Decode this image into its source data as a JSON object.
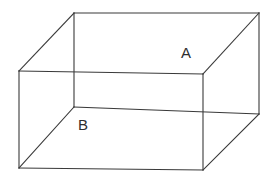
{
  "figure": {
    "name": "rectangular-prism",
    "background_color": "#ffffff",
    "line_color": "#3a3a3a",
    "line_width": 1.1,
    "label_color": "#2e2e2e",
    "labels": [
      {
        "id": "A",
        "text": "A",
        "x": 181,
        "y": 58
      },
      {
        "id": "B",
        "text": "B",
        "x": 78,
        "y": 130
      }
    ],
    "vertices": {
      "back_top_left": {
        "x": 74,
        "y": 13
      },
      "back_top_right": {
        "x": 259,
        "y": 13
      },
      "front_top_left": {
        "x": 19,
        "y": 71
      },
      "front_top_right": {
        "x": 203,
        "y": 74
      },
      "back_bottom_left": {
        "x": 74,
        "y": 107
      },
      "back_bottom_right": {
        "x": 259,
        "y": 114
      },
      "front_bottom_left": {
        "x": 19,
        "y": 168
      },
      "front_bottom_right": {
        "x": 203,
        "y": 170
      }
    },
    "edges": [
      {
        "id": "top-back",
        "d": "M 74 13 L 259 13"
      },
      {
        "id": "top-left-diagonal",
        "d": "M 74 13 L 19 71"
      },
      {
        "id": "top-right-diagonal",
        "d": "M 259 13 L 203 74"
      },
      {
        "id": "top-front",
        "d": "M 19 71 L 203 74"
      },
      {
        "id": "left-vertical",
        "d": "M 19 71 L 19 168"
      },
      {
        "id": "middle-vertical",
        "d": "M 74 13 L 74 107"
      },
      {
        "id": "right-vertical",
        "d": "M 203 74 L 203 170"
      },
      {
        "id": "back-right-vertical",
        "d": "M 259 13 L 259 114"
      },
      {
        "id": "mid-horizontal",
        "d": "M 74 107 L 259 114"
      },
      {
        "id": "bottom-left-diagonal",
        "d": "M 74 107 L 19 168"
      },
      {
        "id": "bottom-right-diagonal",
        "d": "M 259 114 L 203 170"
      },
      {
        "id": "bottom-front",
        "d": "M 19 168 L 203 170"
      }
    ]
  }
}
